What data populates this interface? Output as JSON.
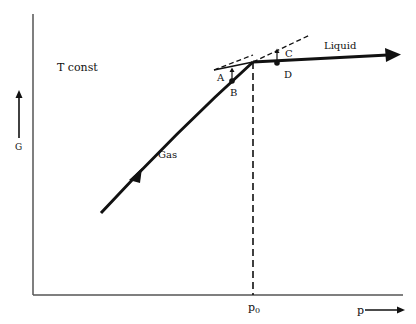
{
  "diagram": {
    "condition_label": "T const",
    "y_axis_label": "G",
    "x_axis_label": "p",
    "x_tick_label": "p",
    "x_tick_subscript": "0",
    "curve_labels": {
      "gas": "Gas",
      "liquid": "Liquid"
    },
    "point_labels": {
      "A": "A",
      "B": "B",
      "C": "C",
      "D": "D"
    },
    "colors": {
      "line": "#111111",
      "axis": "#555555",
      "background": "#ffffff"
    }
  }
}
